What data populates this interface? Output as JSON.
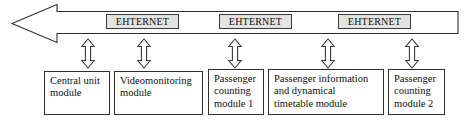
{
  "diagram": {
    "bus": {
      "name": "ethernet-bus-arrow",
      "direction": "left",
      "stroke_color": "#2e2e2e",
      "fill_color": "#ffffff"
    },
    "bus_labels": [
      {
        "text": "EHTERNET",
        "x": 106,
        "y": 14,
        "width": 73
      },
      {
        "text": "EHTERNET",
        "x": 219,
        "y": 14,
        "width": 73
      },
      {
        "text": "EHTERNET",
        "x": 338,
        "y": 14,
        "width": 73
      }
    ],
    "connectors": [
      {
        "name": "connector-arrow-1",
        "x": 80,
        "y": 38
      },
      {
        "name": "connector-arrow-2",
        "x": 136,
        "y": 38
      },
      {
        "name": "connector-arrow-3",
        "x": 227,
        "y": 38
      },
      {
        "name": "connector-arrow-4",
        "x": 320,
        "y": 38
      },
      {
        "name": "connector-arrow-5",
        "x": 404,
        "y": 38
      }
    ],
    "modules": [
      {
        "name": "central-unit-module",
        "lines": [
          "Central unit",
          "module"
        ],
        "x": 44,
        "y": 71,
        "width": 66,
        "height": 44
      },
      {
        "name": "videomonitoring-module",
        "lines": [
          "Videomonitoring",
          "module"
        ],
        "x": 114,
        "y": 71,
        "width": 89,
        "height": 44
      },
      {
        "name": "passenger-counting-module-1",
        "lines": [
          "Passenger",
          "counting",
          "module 1"
        ],
        "x": 208,
        "y": 69,
        "width": 56,
        "height": 46
      },
      {
        "name": "passenger-information-and-dynamical-timetable-module",
        "lines": [
          "Passenger information",
          "and dynamical",
          "timetable module"
        ],
        "x": 268,
        "y": 69,
        "width": 116,
        "height": 46
      },
      {
        "name": "passenger-counting-module-2",
        "lines": [
          "Passenger",
          "counting",
          "module 2"
        ],
        "x": 388,
        "y": 69,
        "width": 57,
        "height": 46
      }
    ]
  }
}
